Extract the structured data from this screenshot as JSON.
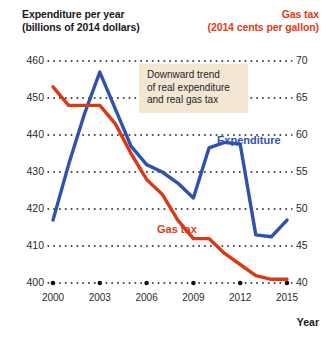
{
  "header": {
    "left_title_line1": "Expenditure per year",
    "left_title_line2": "(billions of 2014 dollars)",
    "right_title_line1": "Gas tax",
    "right_title_line2": "(2014 cents per gallon)"
  },
  "annotation": {
    "line1": "Downward trend",
    "line2": "of real expenditure",
    "line3": "and real gas tax"
  },
  "series_labels": {
    "expenditure": "Expenditure",
    "gas_tax": "Gas tax"
  },
  "colors": {
    "expenditure": "#2f52b0",
    "gas_tax": "#d93a16",
    "annotation_bg": "#f3e7d2",
    "gridline": "#111111",
    "text": "#1a1a1a"
  },
  "chart_data": {
    "type": "line",
    "title": "",
    "xlabel": "Year",
    "grid": true,
    "legend": "inline-labels",
    "x": [
      2000,
      2001,
      2002,
      2003,
      2004,
      2005,
      2006,
      2007,
      2008,
      2009,
      2010,
      2011,
      2012,
      2013,
      2014,
      2015
    ],
    "xticks": [
      "2000",
      "2003",
      "2006",
      "2009",
      "2012",
      "2015"
    ],
    "xtick_values": [
      2000,
      2003,
      2006,
      2009,
      2012,
      2015
    ],
    "xlim": [
      2000,
      2015
    ],
    "axes": [
      {
        "id": "left",
        "label_line1": "Expenditure per year",
        "label_line2": "(billions of 2014 dollars)",
        "ticks": [
          400,
          410,
          420,
          430,
          440,
          450,
          460
        ],
        "ylim": [
          400,
          460
        ]
      },
      {
        "id": "right",
        "label_line1": "Gas tax",
        "label_line2": "(2014 cents per gallon)",
        "ticks": [
          40,
          45,
          50,
          55,
          60,
          65,
          70
        ],
        "ylim": [
          40,
          70
        ]
      }
    ],
    "series": [
      {
        "name": "Expenditure",
        "axis": "left",
        "color": "#2f52b0",
        "unit": "billions of 2014 dollars",
        "values": [
          417.0,
          432.0,
          445.5,
          457.0,
          447.0,
          437.0,
          432.0,
          430.0,
          427.0,
          423.0,
          436.5,
          438.0,
          437.5,
          413.0,
          412.5,
          417.0
        ]
      },
      {
        "name": "Gas tax",
        "axis": "right",
        "color": "#d93a16",
        "unit": "2014 cents per gallon",
        "values": [
          66.5,
          64.0,
          64.0,
          64.0,
          61.5,
          57.5,
          54.0,
          52.0,
          48.5,
          46.0,
          46.0,
          44.0,
          42.5,
          41.0,
          40.5,
          40.5
        ]
      }
    ],
    "annotations": [
      {
        "text": "Downward trend of real expenditure and real gas tax",
        "x": 2004.8,
        "y_left": 452
      }
    ]
  }
}
